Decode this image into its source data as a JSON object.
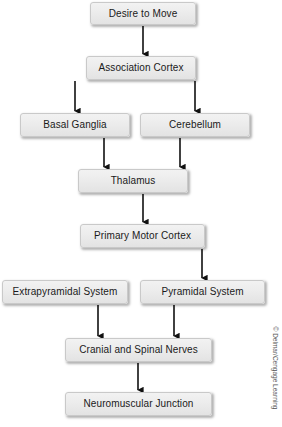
{
  "diagram": {
    "type": "flowchart",
    "orientation": "top-to-bottom",
    "background_color": "#ffffff",
    "node_fill_color": "#ececec",
    "node_border_color": "#c9c9c9",
    "arrow_color": "#111111",
    "nodes": [
      {
        "id": "desire",
        "label": "Desire to Move",
        "x": 90,
        "y": 2,
        "w": 106,
        "h": 23
      },
      {
        "id": "association",
        "label": "Association Cortex",
        "x": 86,
        "y": 56,
        "w": 110,
        "h": 24
      },
      {
        "id": "basal",
        "label": "Basal Ganglia",
        "x": 20,
        "y": 113,
        "w": 110,
        "h": 24
      },
      {
        "id": "cerebellum",
        "label": "Cerebellum",
        "x": 140,
        "y": 113,
        "w": 110,
        "h": 24
      },
      {
        "id": "thalamus",
        "label": "Thalamus",
        "x": 78,
        "y": 169,
        "w": 110,
        "h": 24
      },
      {
        "id": "motorcortex",
        "label": "Primary Motor Cortex",
        "x": 80,
        "y": 224,
        "w": 125,
        "h": 24
      },
      {
        "id": "extrapyramidal",
        "label": "Extrapyramidal System",
        "x": 2,
        "y": 280,
        "w": 126,
        "h": 24
      },
      {
        "id": "pyramidal",
        "label": "Pyramidal System",
        "x": 140,
        "y": 280,
        "w": 125,
        "h": 24
      },
      {
        "id": "nerves",
        "label": "Cranial and Spinal Nerves",
        "x": 65,
        "y": 338,
        "w": 147,
        "h": 24
      },
      {
        "id": "junction",
        "label": "Neuromuscular Junction",
        "x": 65,
        "y": 392,
        "w": 147,
        "h": 24
      }
    ],
    "edges": [
      {
        "from": "desire",
        "to": "association",
        "x1": 143,
        "y1": 26,
        "x2": 143,
        "y2": 54
      },
      {
        "from": "association",
        "to": "basal",
        "x1": 75,
        "y1": 81,
        "x2": 75,
        "y2": 111
      },
      {
        "from": "association",
        "to": "cerebellum",
        "x1": 195,
        "y1": 81,
        "x2": 195,
        "y2": 111
      },
      {
        "from": "basal",
        "to": "thalamus",
        "x1": 104,
        "y1": 138,
        "x2": 104,
        "y2": 167
      },
      {
        "from": "cerebellum",
        "to": "thalamus",
        "x1": 180,
        "y1": 138,
        "x2": 180,
        "y2": 167
      },
      {
        "from": "thalamus",
        "to": "motorcortex",
        "x1": 143,
        "y1": 194,
        "x2": 143,
        "y2": 222
      },
      {
        "from": "motorcortex",
        "to": "pyramidal",
        "x1": 202,
        "y1": 249,
        "x2": 202,
        "y2": 278
      },
      {
        "from": "extrapyramidal",
        "to": "nerves",
        "x1": 98,
        "y1": 305,
        "x2": 98,
        "y2": 336
      },
      {
        "from": "pyramidal",
        "to": "nerves",
        "x1": 174,
        "y1": 305,
        "x2": 174,
        "y2": 336
      },
      {
        "from": "nerves",
        "to": "junction",
        "x1": 138,
        "y1": 363,
        "x2": 138,
        "y2": 390
      }
    ],
    "credit": "© Delmar/Cengage Learning"
  }
}
